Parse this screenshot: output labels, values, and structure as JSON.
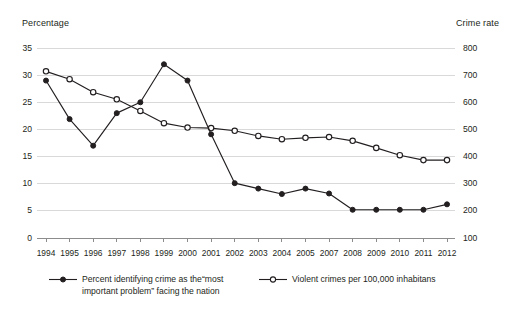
{
  "chart_data": {
    "type": "line",
    "title": "",
    "subtitle": "",
    "xlabel": "",
    "ylabel": "Percentage",
    "y2label": "Crime rate",
    "grid": true,
    "legend_position": "bottom",
    "categories": [
      "1994",
      "1995",
      "1996",
      "1997",
      "1998",
      "1999",
      "2000",
      "2001",
      "2002",
      "2003",
      "2004",
      "2005",
      "2007",
      "2008",
      "2009",
      "2010",
      "2011",
      "2012"
    ],
    "ylim": [
      0,
      35
    ],
    "yticks": [
      "0",
      "5",
      "10",
      "15",
      "20",
      "25",
      "30",
      "35"
    ],
    "y2lim": [
      100,
      800
    ],
    "y2ticks": [
      "100",
      "200",
      "300",
      "400",
      "500",
      "600",
      "700",
      "800"
    ],
    "series": [
      {
        "name": "Percent identifying crime as the“most important problem” facing the nation",
        "axis": "left",
        "marker": "filled-circle",
        "color": "#231f20",
        "values": [
          29.0,
          21.9,
          17.0,
          23.0,
          25.0,
          32.0,
          29.0,
          19.1,
          10.1,
          9.1,
          8.1,
          9.1,
          8.2,
          5.2,
          5.2,
          5.2,
          5.2,
          6.2
        ]
      },
      {
        "name": "Violent crimes per 100,000 inhabitans",
        "axis": "right",
        "marker": "open-circle",
        "color": "#231f20",
        "values": [
          714,
          685,
          637,
          611,
          568,
          523,
          507,
          505,
          495,
          476,
          464,
          469,
          472,
          458,
          432,
          405,
          387,
          387
        ]
      }
    ]
  },
  "axes": {
    "left_title": "Percentage",
    "right_title": "Crime rate"
  },
  "legend": {
    "items": [
      {
        "label": "Percent identifying crime as the“most important problem” facing the nation",
        "marker": "filled-circle"
      },
      {
        "label": "Violent crimes per 100,000 inhabitans",
        "marker": "open-circle"
      }
    ]
  },
  "colors": {
    "ink": "#231f20",
    "grid": "#d9d9d9",
    "background": "#ffffff"
  }
}
